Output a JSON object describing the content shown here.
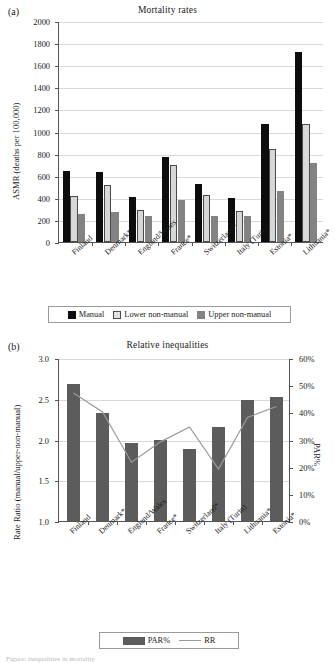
{
  "figure": {
    "panel_a_letter": "(a)",
    "panel_b_letter": "(b)"
  },
  "chart_data": [
    {
      "type": "bar",
      "panel": "(a)",
      "title": "Mortality rates",
      "xlabel": "",
      "ylabel": "ASMR (deaths per 100,000)",
      "ylim": [
        0,
        2000
      ],
      "ytick_step": 200,
      "yticks": [
        "0",
        "200",
        "400",
        "600",
        "800",
        "1000",
        "1200",
        "1400",
        "1600",
        "1800",
        "2000"
      ],
      "grid": true,
      "legend_position": "bottom",
      "categories": [
        "Finland",
        "Denmark*",
        "England/Wales",
        "France*",
        "Switzerland*",
        "Italy (Turin)",
        "Estonia*",
        "Lithuania*"
      ],
      "series": [
        {
          "name": "Manual",
          "color": "#0d0d0d",
          "values": [
            640,
            632,
            410,
            772,
            528,
            396,
            1066,
            1716
          ]
        },
        {
          "name": "Lower non-manual",
          "color": "#d7d7d7",
          "values": [
            418,
            512,
            290,
            696,
            425,
            278,
            844,
            1066
          ]
        },
        {
          "name": "Upper non-manual",
          "color": "#838383",
          "values": [
            250,
            276,
            238,
            384,
            238,
            236,
            466,
            714
          ]
        }
      ]
    },
    {
      "type": "bar",
      "panel": "(b)",
      "title": "Relative inequalities",
      "xlabel": "",
      "ylabel": "Rate Ratio (manual/upper-non-manual)",
      "ylabel_right": "PAR%",
      "ylim": [
        1.0,
        3.0
      ],
      "ytick_step": 0.5,
      "yticks": [
        "1.0",
        "1.5",
        "2.0",
        "2.5",
        "3.0"
      ],
      "ylim_right": [
        0,
        60
      ],
      "yticks_right": [
        "0%",
        "10%",
        "20%",
        "30%",
        "40%",
        "50%",
        "60%"
      ],
      "grid": true,
      "legend_position": "bottom",
      "categories": [
        "Finland",
        "Denmark*",
        "England/Wales",
        "France*",
        "Switzerland*",
        "Italy (Turin)",
        "Lithuania*",
        "Estonia*"
      ],
      "series": [
        {
          "name": "PAR%",
          "kind": "bar",
          "color": "#5c5c5c",
          "axis": "left",
          "values": [
            2.68,
            2.33,
            1.96,
            2.0,
            1.88,
            2.15,
            2.49,
            2.52
          ]
        },
        {
          "name": "RR",
          "kind": "line",
          "color": "#9a9a9a",
          "axis": "right",
          "values": [
            47.5,
            40.5,
            22.0,
            29.5,
            35.0,
            19.5,
            38.5,
            42.5
          ]
        }
      ]
    }
  ],
  "panel_a": {
    "letter": "(a)",
    "title": "Mortality rates",
    "y_axis_label": "ASMR (deaths per 100,000)",
    "y_ticks": [
      "2000",
      "1800",
      "1600",
      "1400",
      "1200",
      "1000",
      "800",
      "600",
      "400",
      "200",
      "0"
    ],
    "x_labels": [
      "Finland",
      "Denmark*",
      "England/Wales",
      "France*",
      "Switzerland*",
      "Italy (Turin)",
      "Estonia*",
      "Lithuania*"
    ],
    "legend": [
      {
        "label": "Manual",
        "swatch": "manual"
      },
      {
        "label": "Lower non-manual",
        "swatch": "lower"
      },
      {
        "label": "Upper non-manual",
        "swatch": "upper"
      }
    ]
  },
  "panel_b": {
    "letter": "(b)",
    "title": "Relative inequalities",
    "y_axis_label": "Rate Ratio (manual/upper-non-manual)",
    "y_axis_label_right": "PAR%",
    "y_ticks": [
      "3.0",
      "2.5",
      "2.0",
      "1.5",
      "1.0"
    ],
    "y_ticks_right": [
      "60%",
      "50%",
      "40%",
      "30%",
      "20%",
      "10%",
      "0%"
    ],
    "x_labels": [
      "Finland",
      "Denmark*",
      "England/Wales",
      "France*",
      "Switzerland*",
      "Italy (Turin)",
      "Lithuania*",
      "Estonia*"
    ],
    "legend": [
      {
        "label": "PAR%",
        "swatch": "par"
      },
      {
        "label": "RR",
        "swatch": "rr"
      }
    ]
  },
  "caption": "Figure: inequalities in mortality"
}
